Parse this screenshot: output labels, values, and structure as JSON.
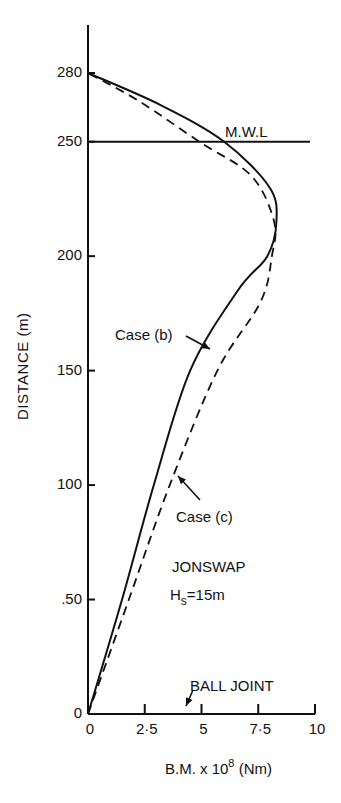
{
  "chart_data": {
    "type": "line",
    "title": "",
    "xlabel": "B.M. x 10^8 (Nm)",
    "xlabel_parts": {
      "prefix": "B.M. x 10",
      "exponent": "8",
      "suffix": " (Nm)"
    },
    "ylabel": "DISTANCE (m)",
    "xlim": [
      0,
      10
    ],
    "ylim": [
      0,
      280
    ],
    "x_ticks": [
      "0",
      "2·5",
      "5",
      "7·5",
      "10"
    ],
    "x_tick_values": [
      0,
      2.5,
      5,
      7.5,
      10
    ],
    "y_ticks": [
      "0",
      ".50",
      "100",
      "150",
      "200",
      "250",
      "280"
    ],
    "y_tick_values": [
      0,
      50,
      100,
      150,
      200,
      250,
      280
    ],
    "grid": false,
    "series": [
      {
        "name": "Case (b)",
        "style": "solid",
        "points": [
          [
            0,
            0
          ],
          [
            1.5,
            50
          ],
          [
            2.9,
            100
          ],
          [
            4.5,
            150
          ],
          [
            6.6,
            185
          ],
          [
            7.9,
            200
          ],
          [
            8.3,
            215
          ],
          [
            8.0,
            230
          ],
          [
            6.0,
            250
          ],
          [
            3.2,
            266
          ],
          [
            0,
            280
          ]
        ]
      },
      {
        "name": "Case (c)",
        "style": "dashed",
        "points": [
          [
            0,
            0
          ],
          [
            1.8,
            50
          ],
          [
            3.6,
            100
          ],
          [
            5.7,
            150
          ],
          [
            7.6,
            180
          ],
          [
            8.1,
            200
          ],
          [
            8.2,
            215
          ],
          [
            7.2,
            235
          ],
          [
            4.9,
            250
          ],
          [
            2.2,
            268
          ],
          [
            0,
            280
          ]
        ]
      }
    ],
    "reference_lines": [
      {
        "label": "M.W.L",
        "y": 250
      }
    ],
    "annotations": [
      {
        "text": "Case (b)",
        "arrow_to": [
          5.4,
          165
        ]
      },
      {
        "text": "Case (c)",
        "arrow_to": [
          3.9,
          105
        ]
      },
      {
        "text": "JONSWAP"
      },
      {
        "text": "Hs = 15m"
      },
      {
        "text": "BALL JOINT",
        "arrow_to": [
          4.2,
          0
        ]
      }
    ]
  },
  "labels": {
    "mwl": "M.W.L",
    "case_b": "Case (b)",
    "case_c": "Case (c)",
    "spectrum": "JONSWAP",
    "hs_main": "H",
    "hs_sub": "s",
    "hs_value": "=15m",
    "ball_joint": "BALL JOINT",
    "ylabel": "DISTANCE (m)"
  },
  "colors": {
    "ink": "#111111",
    "background": "#ffffff"
  }
}
